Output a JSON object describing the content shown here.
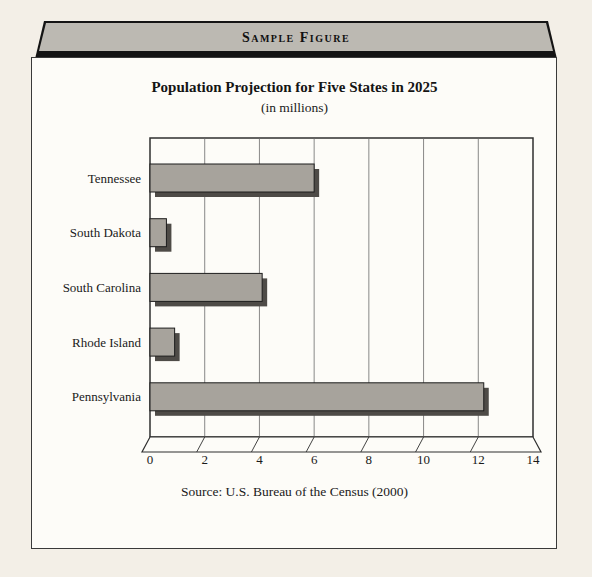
{
  "banner": {
    "label": "Sample Figure"
  },
  "figure": {
    "title": "Population Projection for Five States in 2025",
    "subtitle": "(in millions)",
    "source": "Source: U.S. Bureau of the Census (2000)"
  },
  "chart_data": {
    "type": "bar",
    "orientation": "horizontal",
    "title": "Population Projection for Five States in 2025",
    "subtitle": "(in millions)",
    "source": "Source: U.S. Bureau of the Census (2000)",
    "categories": [
      "Tennessee",
      "South Dakota",
      "South Carolina",
      "Rhode Island",
      "Pennsylvania"
    ],
    "values": [
      6.0,
      0.6,
      4.1,
      0.9,
      12.2
    ],
    "xlabel": "",
    "ylabel": "",
    "xlim": [
      0,
      14
    ],
    "xticks": [
      0,
      2,
      4,
      6,
      8,
      10,
      12,
      14
    ],
    "grid": true,
    "legend": false,
    "style_3d": true,
    "bar_color": "#a7a39c",
    "bar_border_color": "#1d1d1d",
    "bar_shadow_color": "#4e4b47",
    "plot_border_color": "#2f2f2f",
    "gridline_color": "#6b6b6b",
    "plot_background": "#fdfcf8"
  },
  "colors": {
    "page_background": "#f3efe7",
    "box_background": "#fdfcf8",
    "box_border": "#3a3a3a",
    "banner_face": "#bcb9b2",
    "banner_edge": "#141414",
    "text": "#1a1a1a"
  }
}
